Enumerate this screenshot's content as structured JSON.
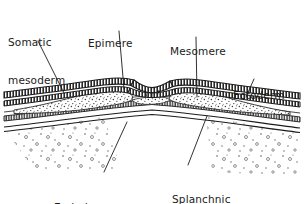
{
  "figure": {
    "stroke_color": "#1b1b1b",
    "background_color": "#ffffff",
    "stipple_color": "#555555",
    "labels": [
      {
        "id": "somatic",
        "name": "somatic-mesoderm",
        "lines": [
          "Somatic",
          "mesoderm"
        ]
      },
      {
        "id": "epimere",
        "name": "epimere",
        "lines": [
          "Epimere"
        ]
      },
      {
        "id": "mesomere",
        "name": "mesomere",
        "lines": [
          "Mesomere"
        ]
      },
      {
        "id": "ectoderm",
        "name": "ectoderm",
        "lines": [
          "Ectoderm"
        ]
      },
      {
        "id": "endoderm",
        "name": "endoderm",
        "lines": [
          "Endoderm"
        ]
      },
      {
        "id": "splanchnic",
        "name": "splanchnic-mesoderm",
        "lines": [
          "Splanchnic",
          "mesoderm"
        ]
      }
    ],
    "label_text": {
      "somatic_line1": "Somatic",
      "somatic_line2": "mesoderm",
      "epimere": "Epimere",
      "mesomere": "Mesomere",
      "ectoderm": "Ectoderm",
      "endoderm": "Endoderm",
      "splanchnic_line1": "Splanchnic",
      "splanchnic_line2": "mesoderm"
    },
    "leader_lines": [
      {
        "name": "leader-somatic",
        "from": [
          38,
          41
        ],
        "to": [
          64,
          93
        ]
      },
      {
        "name": "leader-epimere",
        "from": [
          119,
          31
        ],
        "to": [
          124,
          89
        ]
      },
      {
        "name": "leader-mesomere",
        "from": [
          196,
          37
        ],
        "to": [
          197,
          97
        ]
      },
      {
        "name": "leader-ectoderm",
        "from": [
          254,
          79
        ],
        "to": [
          246,
          97
        ]
      },
      {
        "name": "leader-endoderm",
        "from": [
          104,
          172
        ],
        "to": [
          127,
          122
        ]
      },
      {
        "name": "leader-splanchnic",
        "from": [
          188,
          165
        ],
        "to": [
          207,
          116
        ]
      }
    ]
  }
}
